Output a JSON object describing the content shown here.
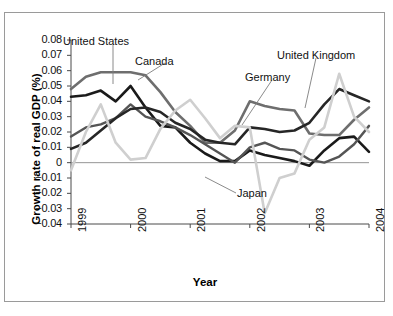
{
  "chart_data": {
    "type": "line",
    "title": "",
    "xlabel": "Year",
    "ylabel": "Growth rate of real GDP (%)",
    "xlim": [
      1999,
      2004
    ],
    "ylim": [
      -0.04,
      0.08
    ],
    "grid": false,
    "legend_position": "inline-annotations",
    "x_tick_labels": [
      "1999",
      "2000",
      "2001",
      "2002",
      "2003",
      "2004"
    ],
    "x_ticks": [
      1999,
      2000,
      2001,
      2002,
      2003,
      2004
    ],
    "y_tick_labels": [
      "0.08",
      "0.07",
      "0.06",
      "0.05",
      "0.04",
      "0.03",
      "0.02",
      "0.01",
      "0",
      "−0.01",
      "−0.02",
      "−0.03",
      "−0.04"
    ],
    "y_ticks": [
      0.08,
      0.07,
      0.06,
      0.05,
      0.04,
      0.03,
      0.02,
      0.01,
      0,
      -0.01,
      -0.02,
      -0.03,
      -0.04
    ],
    "zero_line": 0,
    "x": [
      1999.0,
      1999.25,
      1999.5,
      1999.75,
      2000.0,
      2000.25,
      2000.5,
      2000.75,
      2001.0,
      2001.25,
      2001.5,
      2001.75,
      2002.0,
      2002.25,
      2002.5,
      2002.75,
      2003.0,
      2003.25,
      2003.5,
      2003.75,
      2004.0
    ],
    "series": [
      {
        "name": "United States",
        "color": "#1a1a1a",
        "width": 2.6,
        "values": [
          0.043,
          0.044,
          0.047,
          0.04,
          0.05,
          0.036,
          0.024,
          0.023,
          0.013,
          0.006,
          0.001,
          0.001,
          0.008,
          0.005,
          0.003,
          0.001,
          -0.002,
          0.008,
          0.016,
          0.017,
          0.007
        ]
      },
      {
        "name": "Canada",
        "color": "#6e6e6e",
        "width": 2.6,
        "values": [
          0.048,
          0.056,
          0.059,
          0.059,
          0.059,
          0.057,
          0.046,
          0.033,
          0.024,
          0.013,
          0.013,
          0.021,
          0.04,
          0.037,
          0.035,
          0.034,
          0.019,
          0.018,
          0.018,
          0.028,
          0.036
        ]
      },
      {
        "name": "Germany",
        "color": "#555555",
        "width": 2.4,
        "values": [
          0.017,
          0.023,
          0.025,
          0.029,
          0.038,
          0.03,
          0.027,
          0.023,
          0.018,
          0.012,
          0.006,
          0.0,
          0.01,
          0.013,
          0.009,
          0.008,
          0.002,
          0.0,
          0.004,
          0.012,
          0.024
        ]
      },
      {
        "name": "United Kingdom",
        "color": "#262626",
        "width": 2.6,
        "values": [
          0.009,
          0.013,
          0.021,
          0.029,
          0.035,
          0.036,
          0.033,
          0.026,
          0.022,
          0.015,
          0.013,
          0.012,
          0.023,
          0.022,
          0.02,
          0.021,
          0.026,
          0.038,
          0.048,
          0.044,
          0.04
        ]
      },
      {
        "name": "Japan",
        "color": "#cfcfcf",
        "width": 2.6,
        "values": [
          -0.005,
          0.02,
          0.038,
          0.013,
          0.002,
          0.003,
          0.022,
          0.034,
          0.041,
          0.029,
          0.016,
          0.024,
          0.023,
          -0.033,
          -0.01,
          -0.007,
          0.015,
          0.023,
          0.058,
          0.03,
          0.02
        ]
      }
    ],
    "annotations": [
      {
        "name": "United States",
        "text": "United States"
      },
      {
        "name": "Canada",
        "text": "Canada"
      },
      {
        "name": "Germany",
        "text": "Germany"
      },
      {
        "name": "United Kingdom",
        "text": "United Kingdom"
      },
      {
        "name": "Japan",
        "text": "Japan"
      }
    ]
  },
  "axis": {
    "y_labels": [
      "0.08",
      "0.07",
      "0.06",
      "0.05",
      "0.04",
      "0.03",
      "0.02",
      "0.01",
      "0",
      "−0.01",
      "−0.02",
      "−0.03",
      "−0.04"
    ],
    "x_labels": [
      "1999",
      "2000",
      "2001",
      "2002",
      "2003",
      "2004"
    ],
    "y_title": "Growth rate of real GDP (%)",
    "x_title": "Year"
  },
  "labels": {
    "united_states": "United States",
    "canada": "Canada",
    "germany": "Germany",
    "united_kingdom": "United Kingdom",
    "japan": "Japan"
  },
  "colors": {
    "united_states": "#1a1a1a",
    "canada": "#6e6e6e",
    "germany": "#555555",
    "united_kingdom": "#262626",
    "japan": "#cfcfcf",
    "axis": "#4a4a4a",
    "frame": "#9a9a9a",
    "background": "#ffffff"
  }
}
